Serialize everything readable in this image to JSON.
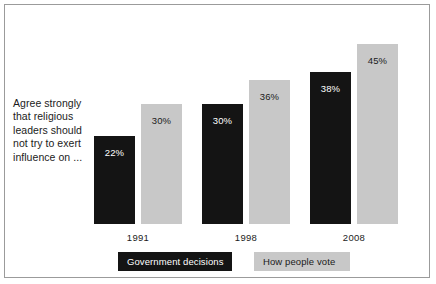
{
  "caption": {
    "lines": [
      "Agree strongly",
      "that religious",
      "leaders should",
      "not try to exert",
      "influence on ..."
    ]
  },
  "colors": {
    "series_dark": "#141414",
    "series_light": "#c8c8c8",
    "frame": "#9b9b9b",
    "background": "#ffffff",
    "text": "#1b1b1b"
  },
  "legend": {
    "items": [
      {
        "label": "Government decisions",
        "color": "#141414"
      },
      {
        "label": "How people vote",
        "color": "#c8c8c8"
      }
    ]
  },
  "chart_data": {
    "type": "bar",
    "title": "",
    "subtitle": "",
    "xlabel": "",
    "ylabel": "",
    "ylim": [
      0,
      50
    ],
    "grid": false,
    "legend_position": "bottom",
    "value_suffix": "%",
    "categories": [
      "1991",
      "1998",
      "2008"
    ],
    "series": [
      {
        "name": "Government decisions",
        "color": "#141414",
        "values": [
          22,
          30,
          38
        ],
        "labels": [
          "22%",
          "30%",
          "38%"
        ]
      },
      {
        "name": "How people vote",
        "color": "#c8c8c8",
        "values": [
          30,
          36,
          45
        ],
        "labels": [
          "30%",
          "36%",
          "45%"
        ]
      }
    ],
    "annotations": [
      "Agree strongly that religious leaders should not try to exert influence on ..."
    ]
  }
}
